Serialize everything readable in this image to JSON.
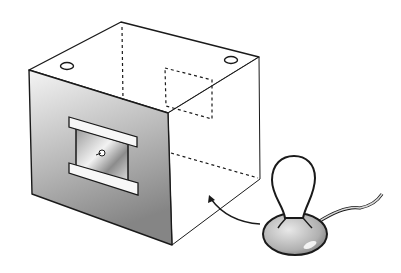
{
  "figure": {
    "elements": {
      "box": {
        "label": "box",
        "holes_on_top": 2,
        "hidden_edges": "dashed"
      },
      "window": {
        "label": "window with slotted frame"
      },
      "joystick": {
        "label": "joystick",
        "has_cable": true
      },
      "arrow": {
        "label": "arrow from joystick to box"
      }
    },
    "colors": {
      "stroke": "#1a1a1a",
      "face_light": "#f4f4f4",
      "face_dark": "#8a8a8a",
      "background": "#ffffff"
    }
  }
}
